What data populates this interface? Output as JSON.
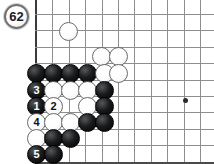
{
  "diagram": {
    "type": "go-board-problem-diagram",
    "board": {
      "grid_spacing": 16.4,
      "origin_x": 36,
      "origin_y": 14,
      "cols": 11,
      "rows": 10,
      "left_edge": true,
      "bottom_edge": true,
      "star_points": [
        {
          "x": 185,
          "y": 100,
          "label": "hoshi"
        }
      ]
    },
    "move_marker": {
      "label": "62",
      "color": "white",
      "position": "outside-board-top-left"
    },
    "stones": [
      {
        "id": "w-a",
        "color": "white",
        "cx": 68,
        "cy": 31,
        "label": ""
      },
      {
        "id": "w-b",
        "color": "white",
        "cx": 101,
        "cy": 56,
        "label": ""
      },
      {
        "id": "w-c",
        "color": "white",
        "cx": 118,
        "cy": 56,
        "label": ""
      },
      {
        "id": "b-a",
        "color": "black",
        "cx": 36,
        "cy": 73,
        "label": ""
      },
      {
        "id": "b-b",
        "color": "black",
        "cx": 53,
        "cy": 73,
        "label": ""
      },
      {
        "id": "b-c",
        "color": "black",
        "cx": 70,
        "cy": 73,
        "label": ""
      },
      {
        "id": "b-d",
        "color": "black",
        "cx": 87,
        "cy": 73,
        "label": ""
      },
      {
        "id": "w-d",
        "color": "white",
        "cx": 104,
        "cy": 73,
        "label": ""
      },
      {
        "id": "w-e",
        "color": "white",
        "cx": 118,
        "cy": 73,
        "label": ""
      },
      {
        "id": "b-3",
        "color": "black",
        "cx": 36,
        "cy": 90,
        "label": "3"
      },
      {
        "id": "w-f",
        "color": "white",
        "cx": 53,
        "cy": 90,
        "label": ""
      },
      {
        "id": "w-g",
        "color": "white",
        "cx": 70,
        "cy": 90,
        "label": ""
      },
      {
        "id": "w-h",
        "color": "white",
        "cx": 87,
        "cy": 90,
        "label": ""
      },
      {
        "id": "b-e",
        "color": "black",
        "cx": 104,
        "cy": 90,
        "label": ""
      },
      {
        "id": "b-1",
        "color": "black",
        "cx": 36,
        "cy": 106,
        "label": "1"
      },
      {
        "id": "w-2",
        "color": "white",
        "cx": 53,
        "cy": 106,
        "label": "2"
      },
      {
        "id": "w-i",
        "color": "white",
        "cx": 87,
        "cy": 106,
        "label": ""
      },
      {
        "id": "b-f",
        "color": "black",
        "cx": 104,
        "cy": 106,
        "label": ""
      },
      {
        "id": "w-4",
        "color": "white",
        "cx": 36,
        "cy": 122,
        "label": "4"
      },
      {
        "id": "w-j",
        "color": "white",
        "cx": 53,
        "cy": 122,
        "label": ""
      },
      {
        "id": "w-k",
        "color": "white",
        "cx": 70,
        "cy": 122,
        "label": ""
      },
      {
        "id": "b-g",
        "color": "black",
        "cx": 87,
        "cy": 122,
        "label": ""
      },
      {
        "id": "b-h",
        "color": "black",
        "cx": 104,
        "cy": 122,
        "label": ""
      },
      {
        "id": "w-l",
        "color": "white",
        "cx": 36,
        "cy": 138,
        "label": ""
      },
      {
        "id": "b-i",
        "color": "black",
        "cx": 53,
        "cy": 138,
        "label": ""
      },
      {
        "id": "b-j",
        "color": "black",
        "cx": 70,
        "cy": 138,
        "label": ""
      },
      {
        "id": "b-5",
        "color": "black",
        "cx": 36,
        "cy": 154,
        "label": "5"
      },
      {
        "id": "b-k",
        "color": "black",
        "cx": 53,
        "cy": 154,
        "label": ""
      }
    ]
  }
}
